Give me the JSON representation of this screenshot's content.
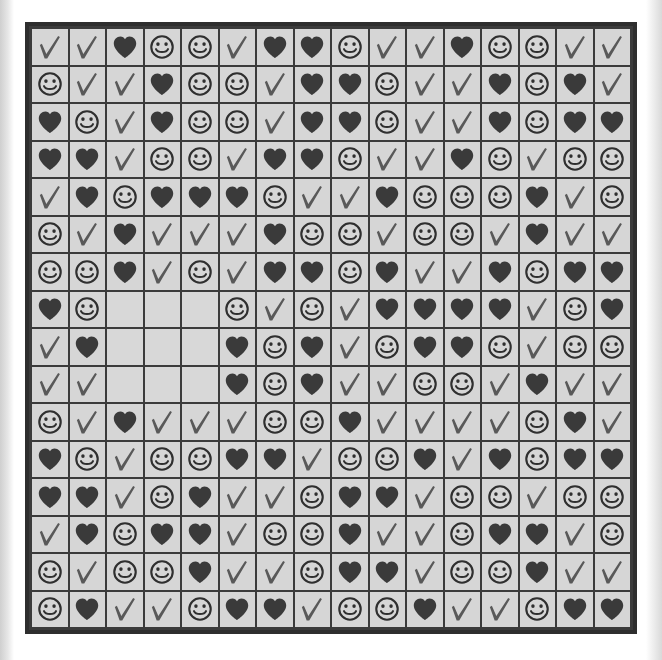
{
  "puzzle": {
    "type": "symbol-grid",
    "rows": 16,
    "columns": 16,
    "symbol_legend": {
      "check": "check-mark-icon",
      "heart": "heart-icon",
      "smiley": "smiley-face-icon",
      "blank": "empty-cell"
    },
    "colors": {
      "cell_background": "#d6d6d6",
      "grid_line": "#3b3b3b",
      "frame_border": "#2e2e2e",
      "check_mark": "#595959",
      "heart": "#3a3a3a",
      "smiley": "#2f2f2f",
      "page_background": "#ffffff"
    },
    "blank_cells": [
      {
        "row": 8,
        "col": 3
      },
      {
        "row": 8,
        "col": 4
      },
      {
        "row": 8,
        "col": 5
      },
      {
        "row": 9,
        "col": 3
      },
      {
        "row": 9,
        "col": 4
      },
      {
        "row": 9,
        "col": 5
      },
      {
        "row": 10,
        "col": 3
      },
      {
        "row": 10,
        "col": 4
      },
      {
        "row": 10,
        "col": 5
      }
    ],
    "cells": [
      [
        "check",
        "check",
        "heart",
        "smiley",
        "smiley",
        "check",
        "heart",
        "heart",
        "smiley",
        "check",
        "check",
        "heart",
        "smiley",
        "smiley",
        "check",
        "check"
      ],
      [
        "smiley",
        "check",
        "check",
        "heart",
        "smiley",
        "smiley",
        "check",
        "heart",
        "heart",
        "smiley",
        "check",
        "check",
        "heart",
        "smiley",
        "heart",
        "check"
      ],
      [
        "heart",
        "smiley",
        "check",
        "heart",
        "smiley",
        "smiley",
        "check",
        "heart",
        "heart",
        "smiley",
        "check",
        "check",
        "heart",
        "smiley",
        "heart",
        "heart"
      ],
      [
        "heart",
        "heart",
        "check",
        "smiley",
        "smiley",
        "check",
        "heart",
        "heart",
        "smiley",
        "check",
        "check",
        "heart",
        "smiley",
        "check",
        "smiley",
        "smiley"
      ],
      [
        "check",
        "heart",
        "smiley",
        "heart",
        "heart",
        "heart",
        "smiley",
        "check",
        "check",
        "heart",
        "smiley",
        "smiley",
        "smiley",
        "heart",
        "check",
        "smiley"
      ],
      [
        "smiley",
        "check",
        "heart",
        "check",
        "check",
        "check",
        "heart",
        "smiley",
        "smiley",
        "check",
        "smiley",
        "smiley",
        "check",
        "heart",
        "check",
        "check"
      ],
      [
        "smiley",
        "smiley",
        "heart",
        "check",
        "smiley",
        "check",
        "heart",
        "heart",
        "smiley",
        "heart",
        "check",
        "check",
        "heart",
        "smiley",
        "heart",
        "heart"
      ],
      [
        "heart",
        "smiley",
        "blank",
        "blank",
        "blank",
        "smiley",
        "check",
        "smiley",
        "check",
        "heart",
        "heart",
        "heart",
        "heart",
        "check",
        "smiley",
        "heart"
      ],
      [
        "check",
        "heart",
        "blank",
        "blank",
        "blank",
        "heart",
        "smiley",
        "heart",
        "check",
        "smiley",
        "heart",
        "heart",
        "smiley",
        "check",
        "smiley",
        "smiley"
      ],
      [
        "check",
        "check",
        "blank",
        "blank",
        "blank",
        "heart",
        "smiley",
        "heart",
        "check",
        "check",
        "smiley",
        "smiley",
        "check",
        "heart",
        "check",
        "check"
      ],
      [
        "smiley",
        "check",
        "heart",
        "check",
        "check",
        "check",
        "smiley",
        "smiley",
        "heart",
        "check",
        "check",
        "check",
        "check",
        "smiley",
        "heart",
        "check"
      ],
      [
        "heart",
        "smiley",
        "check",
        "smiley",
        "smiley",
        "heart",
        "heart",
        "check",
        "smiley",
        "smiley",
        "heart",
        "check",
        "heart",
        "smiley",
        "heart",
        "heart"
      ],
      [
        "heart",
        "heart",
        "check",
        "smiley",
        "heart",
        "check",
        "check",
        "smiley",
        "heart",
        "heart",
        "check",
        "smiley",
        "smiley",
        "check",
        "smiley",
        "smiley"
      ],
      [
        "check",
        "heart",
        "smiley",
        "heart",
        "heart",
        "check",
        "smiley",
        "smiley",
        "heart",
        "check",
        "check",
        "smiley",
        "heart",
        "heart",
        "check",
        "smiley"
      ],
      [
        "smiley",
        "check",
        "smiley",
        "smiley",
        "heart",
        "check",
        "check",
        "smiley",
        "heart",
        "heart",
        "check",
        "smiley",
        "smiley",
        "heart",
        "check",
        "check"
      ],
      [
        "smiley",
        "heart",
        "check",
        "check",
        "smiley",
        "heart",
        "heart",
        "check",
        "smiley",
        "smiley",
        "heart",
        "check",
        "check",
        "smiley",
        "heart",
        "heart"
      ]
    ]
  }
}
